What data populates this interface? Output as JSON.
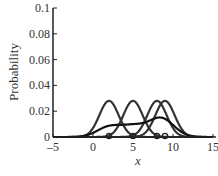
{
  "chart_data": {
    "type": "line",
    "title": "",
    "xlabel": "x",
    "ylabel": "Probability",
    "xlim": [
      -5,
      15
    ],
    "ylim": [
      0,
      0.1
    ],
    "xticks": [
      "-5",
      "0",
      "5",
      "10",
      "15"
    ],
    "yticks": [
      "0",
      "0.02",
      "0.04",
      "0.06",
      "0.08",
      "0.1"
    ],
    "grid": false,
    "legend": null,
    "data_points": [
      2,
      5,
      8,
      9
    ],
    "series": [
      {
        "name": "component 1",
        "mean": 2,
        "sigma": 1.2,
        "peak": 0.028
      },
      {
        "name": "component 2",
        "mean": 5,
        "sigma": 1.2,
        "peak": 0.028
      },
      {
        "name": "component 3",
        "mean": 8,
        "sigma": 1.2,
        "peak": 0.028
      },
      {
        "name": "component 4",
        "mean": 9,
        "sigma": 1.2,
        "peak": 0.028
      },
      {
        "name": "mixture",
        "description": "average of components",
        "plateau": 0.008,
        "peak": 0.014,
        "peak_x": 8.5
      }
    ]
  },
  "axes": {
    "xlabel": "x",
    "ylabel": "Probability",
    "xticks": [
      "–5",
      "0",
      "5",
      "10",
      "15"
    ],
    "yticks": [
      "0",
      "0.02",
      "0.04",
      "0.06",
      "0.08",
      "0.1"
    ]
  },
  "colors": {
    "components": "#333333",
    "mixture": "#111111"
  }
}
